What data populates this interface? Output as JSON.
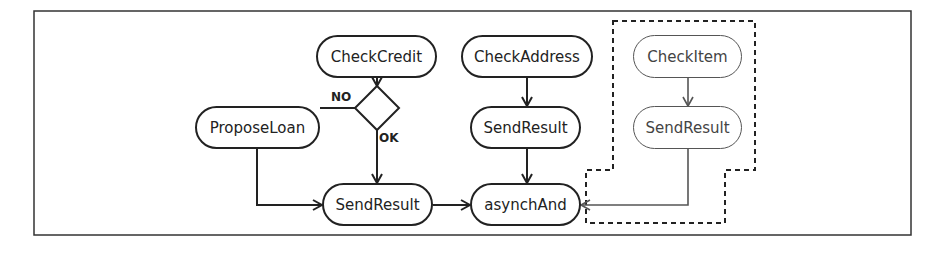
{
  "diagram": {
    "type": "activity-flow",
    "nodes": {
      "check_credit": "CheckCredit",
      "check_address": "CheckAddress",
      "check_item": "CheckItem",
      "propose_loan": "ProposeLoan",
      "send_result_address": "SendResult",
      "send_result_item": "SendResult",
      "send_result_credit": "SendResult",
      "asynch_and": "asynchAnd"
    },
    "decision": {
      "no_label": "NO",
      "ok_label": "OK"
    },
    "edges": [
      {
        "from": "CheckCredit",
        "to": "decision"
      },
      {
        "from": "decision",
        "to": "ProposeLoan",
        "label": "NO"
      },
      {
        "from": "decision",
        "to": "SendResult",
        "label": "OK"
      },
      {
        "from": "ProposeLoan",
        "to": "SendResult"
      },
      {
        "from": "SendResult",
        "to": "asynchAnd"
      },
      {
        "from": "CheckAddress",
        "to": "SendResult"
      },
      {
        "from": "SendResult",
        "to": "asynchAnd"
      },
      {
        "from": "CheckItem",
        "to": "SendResult"
      },
      {
        "from": "SendResult",
        "to": "asynchAnd",
        "style": "open-arrow"
      }
    ],
    "colors": {
      "stroke": "#222222",
      "grey_stroke": "#555555",
      "background": "#ffffff"
    }
  }
}
